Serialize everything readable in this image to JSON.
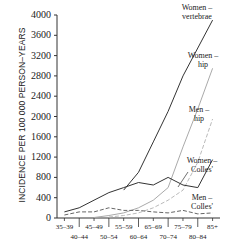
{
  "chart_data": {
    "type": "line",
    "title": "",
    "xlabel": "",
    "ylabel": "INCIDENCE PER 100 000 PERSON–YEARS",
    "ylim": [
      0,
      4000
    ],
    "yticks": [
      0,
      400,
      800,
      1200,
      1600,
      2000,
      2400,
      2800,
      3200,
      3600,
      4000
    ],
    "categories": [
      "35–39",
      "40–44",
      "45–49",
      "50–54",
      "55–59",
      "60–64",
      "65–69",
      "70–74",
      "75–79",
      "80–84",
      "85+"
    ],
    "grid": false,
    "legend_position": "inline labels at right",
    "series": [
      {
        "name": "Women – vertebrae",
        "style": "solid dark",
        "values": [
          null,
          null,
          null,
          null,
          550,
          900,
          1500,
          2100,
          2800,
          3350,
          3900
        ]
      },
      {
        "name": "Women – hip",
        "style": "solid light",
        "values": [
          null,
          null,
          10,
          50,
          100,
          200,
          350,
          600,
          1400,
          2150,
          2950
        ]
      },
      {
        "name": "Men – hip",
        "style": "dashed light",
        "values": [
          null,
          null,
          null,
          20,
          50,
          100,
          200,
          350,
          550,
          1100,
          1950
        ]
      },
      {
        "name": "Women – Colles'",
        "style": "solid dark",
        "values": [
          120,
          200,
          350,
          500,
          600,
          700,
          650,
          800,
          650,
          600,
          1150
        ]
      },
      {
        "name": "Men – Colles'",
        "style": "dashed dark",
        "values": [
          60,
          120,
          120,
          200,
          150,
          150,
          120,
          100,
          150,
          80,
          100
        ]
      }
    ]
  },
  "labels": {
    "women_vertebrae": [
      "Women –",
      "vertebrae"
    ],
    "women_hip": [
      "Women –",
      "hip"
    ],
    "men_hip": [
      "Men –",
      "hip"
    ],
    "women_colles": [
      "Women –",
      "Colles'"
    ],
    "men_colles": [
      "Men –",
      "Colles'"
    ]
  }
}
